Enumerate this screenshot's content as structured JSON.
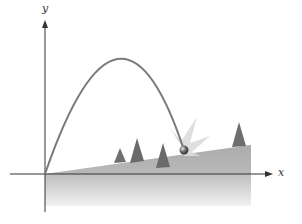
{
  "diagram": {
    "title": "",
    "axes": {
      "x_label": "x",
      "y_label": "y"
    },
    "elements": [
      {
        "type": "parabola",
        "description": "projectile trajectory from origin"
      },
      {
        "type": "slope",
        "description": "inclined hillside ground rising to the right"
      },
      {
        "type": "ball",
        "description": "projectile striking the slope"
      },
      {
        "type": "impact-burst",
        "description": "starburst at impact point"
      },
      {
        "type": "trees",
        "count": 4
      }
    ],
    "colors": {
      "curve": "#7a7a7a",
      "axis": "#333333",
      "ground": "#b8b8b8",
      "tree": "#6e6e6e",
      "burst": "#d9d9d9",
      "ball": "#555555"
    }
  }
}
